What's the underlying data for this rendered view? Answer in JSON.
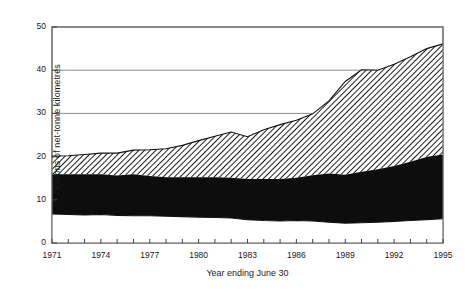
{
  "chart_data": {
    "type": "area",
    "title": "",
    "xlabel": "Year ending June 30",
    "ylabel": "Billions of net-tonne kilometres",
    "xlim": [
      1971,
      1995
    ],
    "ylim": [
      0,
      50
    ],
    "grid": true,
    "legend": "none",
    "stacked": true,
    "x_tick_labels": [
      "1971",
      "1974",
      "1977",
      "1980",
      "1983",
      "1986",
      "1989",
      "1992",
      "1995"
    ],
    "x_tick_values": [
      1971,
      1974,
      1977,
      1980,
      1983,
      1986,
      1989,
      1992,
      1995
    ],
    "y_tick_labels": [
      "0",
      "10",
      "20",
      "30",
      "40",
      "50"
    ],
    "y_tick_values": [
      0,
      10,
      20,
      30,
      40,
      50
    ],
    "x": [
      1971,
      1972,
      1973,
      1974,
      1975,
      1976,
      1977,
      1978,
      1979,
      1980,
      1981,
      1982,
      1983,
      1984,
      1985,
      1986,
      1987,
      1988,
      1989,
      1990,
      1991,
      1992,
      1993,
      1994,
      1995
    ],
    "series": [
      {
        "name": "lower band",
        "fill": "white",
        "values": [
          6.7,
          6.6,
          6.5,
          6.6,
          6.4,
          6.3,
          6.3,
          6.2,
          6.1,
          6.0,
          5.9,
          5.8,
          5.4,
          5.2,
          5.1,
          5.2,
          5.1,
          4.8,
          4.6,
          4.7,
          4.8,
          5.0,
          5.2,
          5.4,
          5.6
        ]
      },
      {
        "name": "middle band",
        "fill": "black",
        "values": [
          9.2,
          9.3,
          9.4,
          9.3,
          9.2,
          9.6,
          9.2,
          9.0,
          9.1,
          9.2,
          9.3,
          9.3,
          9.4,
          9.6,
          9.7,
          9.9,
          10.6,
          11.3,
          11.2,
          11.8,
          12.3,
          12.8,
          13.6,
          14.5,
          14.9
        ]
      },
      {
        "name": "upper band",
        "fill": "hatched",
        "values": [
          4.2,
          4.3,
          4.6,
          4.9,
          5.2,
          5.6,
          6.1,
          6.6,
          7.4,
          8.5,
          9.5,
          10.6,
          9.8,
          11.4,
          12.6,
          13.3,
          14.2,
          16.8,
          21.6,
          23.6,
          22.9,
          23.6,
          24.3,
          25.1,
          25.6
        ]
      }
    ],
    "cumulative_totals": [
      20.1,
      20.2,
      20.5,
      20.8,
      20.8,
      21.5,
      21.6,
      21.8,
      22.6,
      23.7,
      24.7,
      25.7,
      24.6,
      26.2,
      27.4,
      28.4,
      29.9,
      32.9,
      37.4,
      40.1,
      40.0,
      41.4,
      43.1,
      45.0,
      46.1
    ],
    "cumulative_mid": [
      15.9,
      15.9,
      15.9,
      15.9,
      15.6,
      15.9,
      15.5,
      15.2,
      15.2,
      15.2,
      15.2,
      15.1,
      14.8,
      14.8,
      14.8,
      15.1,
      15.7,
      16.1,
      15.8,
      16.5,
      17.1,
      17.8,
      18.8,
      19.9,
      20.5
    ]
  }
}
